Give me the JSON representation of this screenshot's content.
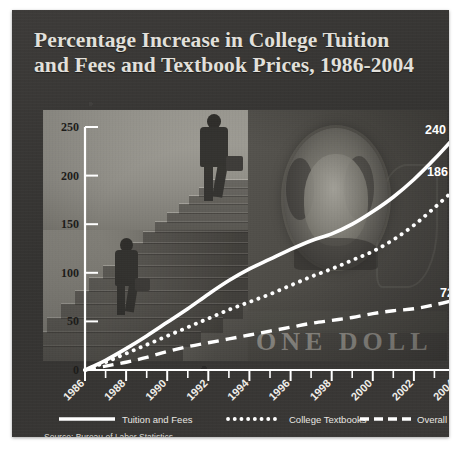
{
  "title": {
    "line1": "Percentage Increase in College Tuition",
    "line2": "and Fees and Textbook Prices, 1986-2004"
  },
  "source": "Source: Bureau of Labor Statistics.",
  "legend": [
    {
      "label": "Tuition and Fees",
      "style": "solid"
    },
    {
      "label": "College Textbooks",
      "style": "dotted"
    },
    {
      "label": "Overall Prices",
      "style": "dashed"
    }
  ],
  "end_labels": {
    "tuition": "240",
    "textbooks": "186",
    "overall": "72"
  },
  "photo": {
    "bill_text": "ONE DOLL"
  },
  "colors": {
    "card_background": "#373634",
    "title_text": "#e2e0db",
    "series_line": "#ffffff",
    "axis": "#ffffff",
    "axis_tick_label": "#1d1c1a",
    "x_tick_label": "#f0eee9"
  },
  "chart_data": {
    "type": "line",
    "title": "Percentage Increase in College Tuition and Fees and Textbook Prices, 1986-2004",
    "xlabel": "",
    "ylabel": "",
    "xlim": [
      1986,
      2004
    ],
    "ylim": [
      0,
      250
    ],
    "yticks": [
      0,
      50,
      100,
      150,
      200,
      250
    ],
    "xticks": [
      1986,
      1988,
      1990,
      1992,
      1994,
      1996,
      1998,
      2000,
      2002,
      2004
    ],
    "xticks_minor": [
      1987,
      1989,
      1991,
      1993,
      1995,
      1997,
      1999,
      2001,
      2003
    ],
    "grid": false,
    "legend_position": "bottom",
    "x": [
      1986,
      1987,
      1988,
      1989,
      1990,
      1991,
      1992,
      1993,
      1994,
      1995,
      1996,
      1997,
      1998,
      1999,
      2000,
      2001,
      2002,
      2003,
      2004
    ],
    "series": [
      {
        "name": "Tuition and Fees",
        "style": "solid",
        "end_label": "240",
        "values": [
          0,
          10,
          22,
          35,
          49,
          63,
          78,
          92,
          104,
          114,
          124,
          133,
          140,
          150,
          163,
          178,
          196,
          217,
          240
        ]
      },
      {
        "name": "College Textbooks",
        "style": "dotted",
        "end_label": "186",
        "values": [
          0,
          8,
          17,
          26,
          35,
          44,
          53,
          62,
          70,
          78,
          87,
          96,
          104,
          113,
          122,
          134,
          149,
          167,
          186
        ]
      },
      {
        "name": "Overall Prices",
        "style": "dashed",
        "end_label": "72",
        "values": [
          0,
          4,
          8,
          13,
          19,
          24,
          28,
          32,
          36,
          40,
          44,
          48,
          51,
          54,
          58,
          61,
          63,
          67,
          72
        ]
      }
    ]
  }
}
